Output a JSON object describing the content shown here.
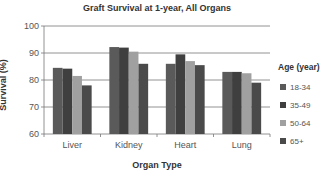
{
  "chart_data": {
    "type": "bar",
    "title": "Graft Survival at 1-year, All Organs",
    "xlabel": "Organ Type",
    "ylabel": "Survival (%)",
    "ylim": [
      60,
      100
    ],
    "yticks": [
      60,
      70,
      80,
      90,
      100
    ],
    "grid": true,
    "legend_position": "right",
    "legend_title": "Age (year)",
    "categories": [
      "Liver",
      "Kidney",
      "Heart",
      "Lung"
    ],
    "series": [
      {
        "name": "18-34",
        "color": "#5a5a5a",
        "values": [
          84.5,
          92.2,
          86.0,
          83.0
        ]
      },
      {
        "name": "35-49",
        "color": "#3f3f3f",
        "values": [
          84.2,
          92.0,
          89.5,
          83.0
        ]
      },
      {
        "name": "50-64",
        "color": "#a0a0a0",
        "values": [
          81.5,
          90.5,
          87.0,
          82.5
        ]
      },
      {
        "name": "65+",
        "color": "#4a4a4a",
        "values": [
          78.0,
          86.0,
          85.5,
          79.0
        ]
      }
    ]
  }
}
